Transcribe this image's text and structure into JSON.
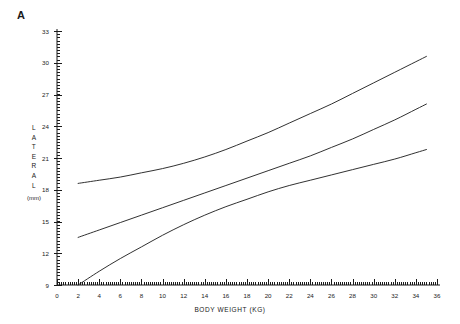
{
  "figure": {
    "panel_label": "A",
    "background_color": "#ffffff",
    "line_color": "#1a1a1a",
    "axis_color": "#1a1a1a"
  },
  "chart_data": {
    "type": "line",
    "title": "",
    "panel": "A",
    "xlabel": "BODY WEIGHT (KG)",
    "ylabel": "LATERAL",
    "ylabel_letters": [
      "L",
      "A",
      "T",
      "E",
      "R",
      "A",
      "L"
    ],
    "yunits": "(mm)",
    "xlim": [
      0,
      36
    ],
    "ylim": [
      9,
      33
    ],
    "xticks": [
      0,
      2,
      4,
      6,
      8,
      10,
      12,
      14,
      16,
      18,
      20,
      22,
      24,
      26,
      28,
      30,
      32,
      34,
      36
    ],
    "xtick_labels": [
      "0",
      "2",
      "4",
      "6",
      "8",
      "10",
      "12",
      "14",
      "16",
      "18",
      "20",
      "22",
      "24",
      "26",
      "28",
      "30",
      "32",
      "34",
      "36"
    ],
    "yticks": [
      9,
      12,
      15,
      18,
      21,
      24,
      27,
      30,
      33
    ],
    "ytick_labels": [
      "9",
      "12",
      "15",
      "18",
      "21",
      "24",
      "27",
      "30",
      "33"
    ],
    "x_minor_step": 0.2,
    "y_minor_step": 0.3,
    "grid": false,
    "legend": "none",
    "series": [
      {
        "name": "upper",
        "x": [
          2,
          4,
          6,
          8,
          10,
          12,
          14,
          16,
          18,
          20,
          22,
          24,
          26,
          28,
          30,
          32,
          34,
          35
        ],
        "values": [
          18.6,
          18.9,
          19.2,
          19.6,
          20.0,
          20.5,
          21.1,
          21.8,
          22.6,
          23.4,
          24.3,
          25.2,
          26.1,
          27.1,
          28.1,
          29.1,
          30.1,
          30.6
        ]
      },
      {
        "name": "middle",
        "x": [
          2,
          4,
          6,
          8,
          10,
          12,
          14,
          16,
          18,
          20,
          22,
          24,
          26,
          28,
          30,
          32,
          34,
          35
        ],
        "values": [
          13.5,
          14.2,
          14.9,
          15.6,
          16.3,
          17.0,
          17.7,
          18.4,
          19.1,
          19.8,
          20.5,
          21.2,
          22.0,
          22.8,
          23.7,
          24.6,
          25.6,
          26.1
        ]
      },
      {
        "name": "lower",
        "x": [
          2,
          4,
          6,
          8,
          10,
          12,
          14,
          16,
          18,
          20,
          22,
          24,
          26,
          28,
          30,
          32,
          34,
          35
        ],
        "values": [
          9.0,
          10.3,
          11.5,
          12.6,
          13.7,
          14.7,
          15.6,
          16.4,
          17.1,
          17.8,
          18.4,
          18.9,
          19.4,
          19.9,
          20.4,
          20.9,
          21.5,
          21.8
        ]
      }
    ]
  }
}
